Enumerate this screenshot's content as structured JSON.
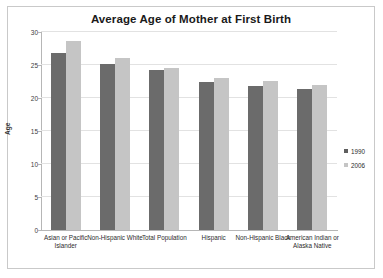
{
  "chart_data": {
    "type": "bar",
    "title": "Average Age of Mother at First Birth",
    "xlabel": "",
    "ylabel": "Age",
    "ylim": [
      0,
      30
    ],
    "ytick_step": 5,
    "yticks": [
      0,
      5,
      10,
      15,
      20,
      25,
      30
    ],
    "grid": true,
    "legend_position": "right",
    "categories": [
      "Asian or Pacific Islander",
      "Non-Hispanic White",
      "Total Population",
      "Hispanic",
      "Non-Hispanic Black",
      "American Indian or Alaska Native"
    ],
    "series": [
      {
        "name": "1990",
        "color": "#6b6b6b",
        "values": [
          26.8,
          25.1,
          24.2,
          22.5,
          21.8,
          21.3
        ]
      },
      {
        "name": "2006",
        "color": "#c5c5c5",
        "values": [
          28.6,
          26.0,
          24.6,
          23.0,
          22.6,
          21.9
        ]
      }
    ]
  }
}
